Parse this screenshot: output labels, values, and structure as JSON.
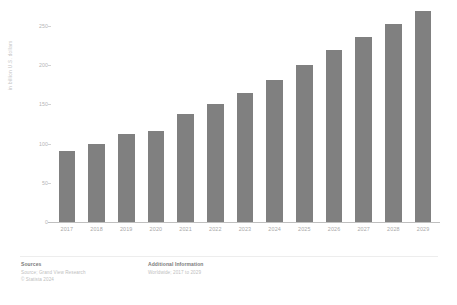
{
  "chart_data": {
    "type": "bar",
    "title": "",
    "subtitle": "",
    "xlabel": "",
    "ylabel": "in billion U.S. dollars",
    "categories": [
      "2017",
      "2018",
      "2019",
      "2020",
      "2021",
      "2022",
      "2023",
      "2024",
      "2025",
      "2026",
      "2027",
      "2028",
      "2029"
    ],
    "values": [
      90,
      99,
      112,
      116,
      138,
      150,
      165,
      181,
      200,
      220,
      236,
      253,
      269
    ],
    "series": [
      {
        "name": "Market size",
        "values": [
          90,
          99,
          112,
          116,
          138,
          150,
          165,
          181,
          200,
          220,
          236,
          253,
          269
        ]
      }
    ],
    "ylim": [
      0,
      250
    ],
    "y_ticks": [
      0,
      50,
      100,
      150,
      200,
      250
    ],
    "y_tick_labels": [
      "0",
      "50",
      "100",
      "150",
      "200",
      "250"
    ],
    "grid": false,
    "legend": "none",
    "bar_color": "#808080"
  },
  "axis": {
    "y_title": "in billion U.S. dollars",
    "y_tick_labels": [
      "250",
      "200",
      "150",
      "100",
      "50",
      "0"
    ],
    "x_tick_labels": [
      "2017",
      "2018",
      "2019",
      "2020",
      "2021",
      "2022",
      "2023",
      "2024",
      "2025",
      "2026",
      "2027",
      "2028",
      "2029"
    ]
  },
  "footer": {
    "sources_heading": "Sources",
    "sources_lines": [
      "Source; Grand View Research",
      "© Statista 2024"
    ],
    "additional_heading": "Additional Information",
    "additional_lines": [
      "Worldwide; 2017 to 2029"
    ]
  },
  "colors": {
    "bar": "#808080",
    "axis_line": "#bfbfbf",
    "tick_text": "#a8a8a8",
    "background": "#ffffff"
  }
}
